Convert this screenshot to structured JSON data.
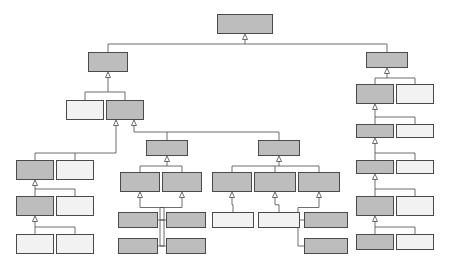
{
  "diagram": {
    "notation": "UML generalization",
    "constraint_label": "{disjoint, complete}",
    "colors": {
      "shaded_fill": "#bdbdbd",
      "light_fill": "#f2f2f2",
      "stroke": "#4a4a4a",
      "text": "#141414",
      "background": "#ffffff"
    }
  },
  "nodes": [
    {
      "id": "entity",
      "label": "Entity",
      "x": 217,
      "y": 14,
      "w": 56,
      "h": 20,
      "fill": "shaded",
      "abstract": false
    },
    {
      "id": "type",
      "label": "Type",
      "x": 88,
      "y": 52,
      "w": 40,
      "h": 20,
      "fill": "shaded",
      "abstract": false
    },
    {
      "id": "individual",
      "label": "Individual",
      "x": 366,
      "y": 52,
      "w": 42,
      "h": 16,
      "fill": "shaded",
      "abstract": false
    },
    {
      "id": "perdurant_type",
      "label": "Perdurant\nType",
      "x": 66,
      "y": 100,
      "w": 38,
      "h": 20,
      "fill": "light",
      "abstract": false
    },
    {
      "id": "endurant_type",
      "label": "Endurant\nType",
      "x": 106,
      "y": 100,
      "w": 38,
      "h": 20,
      "fill": "shaded",
      "abstract": true
    },
    {
      "id": "concrete_individual",
      "label": "Concrete\nIndividual",
      "x": 356,
      "y": 84,
      "w": 38,
      "h": 20,
      "fill": "shaded",
      "abstract": false
    },
    {
      "id": "abstract_individual",
      "label": "Abstract\nIndividual",
      "x": 396,
      "y": 84,
      "w": 38,
      "h": 20,
      "fill": "light",
      "abstract": false
    },
    {
      "id": "endurant",
      "label": "Endurant",
      "x": 356,
      "y": 124,
      "w": 38,
      "h": 14,
      "fill": "shaded",
      "abstract": false
    },
    {
      "id": "perdurant",
      "label": "Perdurant",
      "x": 396,
      "y": 124,
      "w": 38,
      "h": 14,
      "fill": "light",
      "abstract": false
    },
    {
      "id": "moment",
      "label": "Moment",
      "x": 356,
      "y": 160,
      "w": 38,
      "h": 14,
      "fill": "shaded",
      "abstract": false
    },
    {
      "id": "substantial",
      "label": "Substantial",
      "x": 396,
      "y": 160,
      "w": 38,
      "h": 14,
      "fill": "light",
      "abstract": false
    },
    {
      "id": "intrinsic_moment",
      "label": "Intrinsic\nMoment",
      "x": 356,
      "y": 196,
      "w": 38,
      "h": 20,
      "fill": "shaded",
      "abstract": false
    },
    {
      "id": "relator",
      "label": "Relator",
      "x": 396,
      "y": 196,
      "w": 38,
      "h": 20,
      "fill": "light",
      "abstract": false
    },
    {
      "id": "quality",
      "label": "Quality",
      "x": 356,
      "y": 234,
      "w": 38,
      "h": 16,
      "fill": "shaded",
      "abstract": false
    },
    {
      "id": "mode",
      "label": "Mode",
      "x": 396,
      "y": 234,
      "w": 38,
      "h": 16,
      "fill": "light",
      "abstract": false
    },
    {
      "id": "moment_type",
      "label": "Moment\nType",
      "x": 16,
      "y": 160,
      "w": 38,
      "h": 20,
      "fill": "shaded",
      "abstract": false
    },
    {
      "id": "substantial_type",
      "label": "Substantial\nType",
      "x": 56,
      "y": 160,
      "w": 38,
      "h": 20,
      "fill": "light",
      "abstract": false
    },
    {
      "id": "intrinsic_moment_type",
      "label": "Intrinsic\nMoment Type",
      "x": 16,
      "y": 196,
      "w": 38,
      "h": 20,
      "fill": "shaded",
      "abstract": true
    },
    {
      "id": "relator_type",
      "label": "Relator\nType",
      "x": 56,
      "y": 196,
      "w": 38,
      "h": 20,
      "fill": "light",
      "abstract": false
    },
    {
      "id": "quality_type",
      "label": "Quality\nType",
      "x": 16,
      "y": 234,
      "w": 38,
      "h": 20,
      "fill": "light",
      "abstract": false
    },
    {
      "id": "mode_type",
      "label": "Mode Type",
      "x": 56,
      "y": 234,
      "w": 38,
      "h": 20,
      "fill": "light",
      "abstract": false
    },
    {
      "id": "sortal",
      "label": "Sortal",
      "x": 146,
      "y": 140,
      "w": 42,
      "h": 16,
      "fill": "shaded",
      "abstract": true
    },
    {
      "id": "nonsortal",
      "label": "NonSortal",
      "x": 258,
      "y": 140,
      "w": 42,
      "h": 16,
      "fill": "shaded",
      "abstract": true
    },
    {
      "id": "rigid_sortal",
      "label": "Rigid Sortal",
      "x": 120,
      "y": 172,
      "w": 40,
      "h": 20,
      "fill": "shaded",
      "abstract": true
    },
    {
      "id": "anti_rigid_sortal",
      "label": "Anti–Rigid\nSortal",
      "x": 162,
      "y": 172,
      "w": 40,
      "h": 20,
      "fill": "shaded",
      "abstract": true
    },
    {
      "id": "rigid_nonsortal",
      "label": "Rigid\nNonSortal",
      "x": 212,
      "y": 172,
      "w": 40,
      "h": 20,
      "fill": "shaded",
      "abstract": true
    },
    {
      "id": "semi_rigid_nonsortal",
      "label": "Semi–Rigid\nNonSortal",
      "x": 254,
      "y": 172,
      "w": 42,
      "h": 20,
      "fill": "shaded",
      "abstract": true
    },
    {
      "id": "anti_rigid_nonsortal",
      "label": "Anti–Rigid\nNonSortal",
      "x": 298,
      "y": 172,
      "w": 42,
      "h": 20,
      "fill": "shaded",
      "abstract": true
    },
    {
      "id": "kind",
      "label": "Kind",
      "x": 118,
      "y": 212,
      "w": 40,
      "h": 16,
      "fill": "shaded",
      "abstract": false
    },
    {
      "id": "subkind",
      "label": "Subkind",
      "x": 118,
      "y": 238,
      "w": 40,
      "h": 16,
      "fill": "shaded",
      "abstract": false
    },
    {
      "id": "phase",
      "label": "Phase",
      "x": 166,
      "y": 212,
      "w": 40,
      "h": 16,
      "fill": "shaded",
      "abstract": false
    },
    {
      "id": "role",
      "label": "Role",
      "x": 166,
      "y": 238,
      "w": 40,
      "h": 16,
      "fill": "shaded",
      "abstract": false
    },
    {
      "id": "category",
      "label": "Category",
      "x": 212,
      "y": 212,
      "w": 42,
      "h": 16,
      "fill": "light",
      "abstract": false
    },
    {
      "id": "mixin",
      "label": "Mixin",
      "x": 258,
      "y": 212,
      "w": 42,
      "h": 16,
      "fill": "light",
      "abstract": false
    },
    {
      "id": "phase_mixin",
      "label": "Phase Mixin",
      "x": 304,
      "y": 212,
      "w": 44,
      "h": 16,
      "fill": "shaded",
      "abstract": false
    },
    {
      "id": "role_mixin",
      "label": "Role Mixin",
      "x": 304,
      "y": 238,
      "w": 44,
      "h": 16,
      "fill": "shaded",
      "abstract": false
    }
  ],
  "constraint_labels": [
    {
      "id": "c-entity",
      "text": "{disjoint, complete}",
      "x": 250,
      "y": 40
    },
    {
      "id": "c-type",
      "text": "{disjoint, complete}",
      "x": 112,
      "y": 86
    },
    {
      "id": "c-individual",
      "text": "{disjoint, complete}",
      "x": 389,
      "y": 72
    },
    {
      "id": "c-concrete",
      "text": "{disjoint, complete}",
      "x": 389,
      "y": 112
    },
    {
      "id": "c-endurant",
      "text": "{disjoint, complete}",
      "x": 389,
      "y": 148
    },
    {
      "id": "c-moment",
      "text": "{disjoint, complete}",
      "x": 389,
      "y": 184
    },
    {
      "id": "c-intrinsic",
      "text": "{disjoint, complete}",
      "x": 389,
      "y": 222
    },
    {
      "id": "c-endtype",
      "text": "{disjoint, complete}",
      "x": 44,
      "y": 148
    },
    {
      "id": "c-momtype",
      "text": "{disjoint, complete}",
      "x": 44,
      "y": 184
    },
    {
      "id": "c-intmomtype",
      "text": "{disjoint, complete}",
      "x": 44,
      "y": 222
    },
    {
      "id": "c-sortalsplit",
      "text": "{disjoint, complete}",
      "x": 152,
      "y": 128
    },
    {
      "id": "c-sortal",
      "text": "{disjoint, complete}",
      "x": 176,
      "y": 162
    },
    {
      "id": "c-nonsortal",
      "text": "{disjoint, complete}",
      "x": 214,
      "y": 162
    },
    {
      "id": "c-rigidsortal",
      "text": "{disjoint,\ncomplete}",
      "x": 118,
      "y": 196
    },
    {
      "id": "c-antirigid",
      "text": "{disjoint,\ncomplete}",
      "x": 166,
      "y": 196
    },
    {
      "id": "c-antirignon",
      "text": "{disjoint,\ncomplete}",
      "x": 322,
      "y": 194
    }
  ]
}
